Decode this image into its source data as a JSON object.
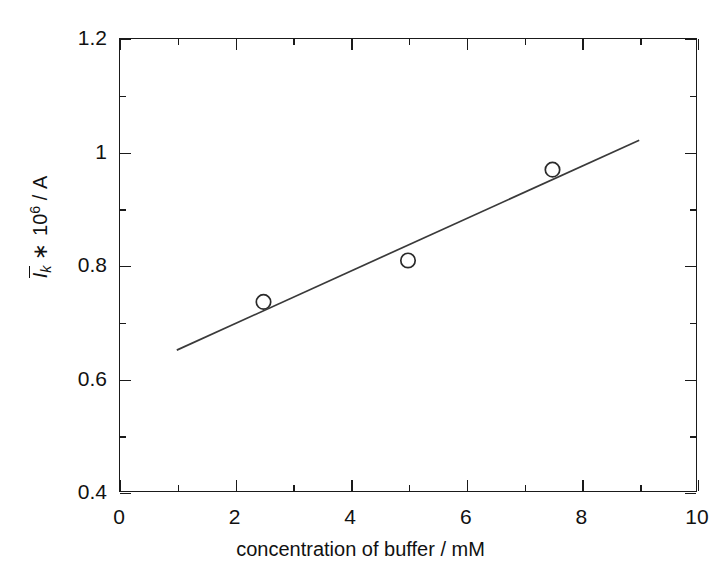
{
  "chart_data": {
    "type": "scatter",
    "title": "",
    "xlabel": "concentration of buffer / mM",
    "ylabel": "Īk * 10⁶ / A",
    "ylabel_parts": {
      "symbol": "I",
      "overbar": true,
      "subscript": "k",
      "operator": "∗",
      "factor_base": "10",
      "factor_exponent": "6",
      "separator": "/",
      "unit": "A"
    },
    "xlim": [
      0,
      10
    ],
    "ylim": [
      0.4,
      1.2
    ],
    "grid": false,
    "legend": null,
    "xticks": [
      0,
      2,
      4,
      6,
      8,
      10
    ],
    "xticklabels": [
      "0",
      "2",
      "4",
      "6",
      "8",
      "10"
    ],
    "xminorticks": [
      1,
      3,
      5,
      7,
      9
    ],
    "yticks": [
      0.4,
      0.6,
      0.8,
      1.0,
      1.2
    ],
    "yticklabels": [
      "0.4",
      "0.6",
      "0.8",
      "1",
      "1.2"
    ],
    "yminorticks": [
      0.5,
      0.7,
      0.9,
      1.1
    ],
    "tick_direction": "in",
    "series": [
      {
        "name": "measured points",
        "type": "scatter",
        "marker": "open-circle",
        "x": [
          2.5,
          5.0,
          7.5
        ],
        "y": [
          0.735,
          0.808,
          0.968
        ]
      },
      {
        "name": "linear fit",
        "type": "line",
        "x": [
          1.0,
          9.0
        ],
        "y": [
          0.65,
          1.02
        ]
      }
    ]
  },
  "style": {
    "background": "#ffffff",
    "axis_color": "#1a1a1a",
    "line_color": "#3a3a3a",
    "marker_edge_color": "#2a2a2a",
    "marker_face_color": "none",
    "text_color": "#111111"
  },
  "axis_labels": {
    "x_title": "concentration of buffer / mM"
  }
}
